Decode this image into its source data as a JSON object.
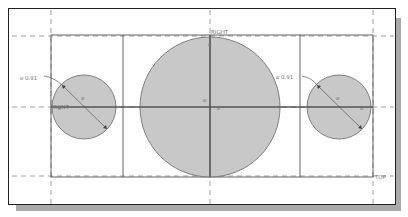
{
  "viewport": {
    "background": "#ffffff",
    "shadow_color": "#a9a9a9",
    "circle_fill": "#c8c8c8",
    "line_color": "#555555"
  },
  "datums": {
    "right_label": "RIGHT",
    "top_label": "TOP",
    "front_label_left": "FRONT"
  },
  "dimensions": {
    "left_circle_diameter": "⌀ 0.91",
    "right_circle_diameter": "⌀ 0.91"
  },
  "constraint_symbols": {
    "symbol": "⌀"
  }
}
